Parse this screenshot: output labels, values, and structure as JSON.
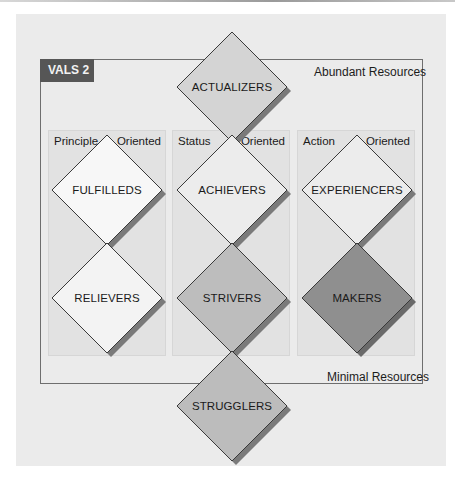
{
  "diagram": {
    "title_badge": "VALS 2",
    "top_label": "Abundant Resources",
    "bottom_label": "Minimal Resources",
    "columns": [
      {
        "left": "Principle",
        "right": "Oriented"
      },
      {
        "left": "Status",
        "right": "Oriented"
      },
      {
        "left": "Action",
        "right": "Oriented"
      }
    ],
    "segments": {
      "actualizers": {
        "label": "ACTUALIZERS",
        "fill": "#d4d4d4"
      },
      "fulfilleds": {
        "label": "FULFILLEDS",
        "fill": "#f7f7f7"
      },
      "achievers": {
        "label": "ACHIEVERS",
        "fill": "#ececec"
      },
      "experiencers": {
        "label": "EXPERIENCERS",
        "fill": "#ececec"
      },
      "relievers": {
        "label": "RELIEVERS",
        "fill": "#f3f3f3"
      },
      "strivers": {
        "label": "STRIVERS",
        "fill": "#bdbdbd"
      },
      "makers": {
        "label": "MAKERS",
        "fill": "#8f8f8f"
      },
      "strugglers": {
        "label": "STRUGGLERS",
        "fill": "#bcbcbc"
      }
    },
    "colors": {
      "badge_bg": "#565656",
      "panel_bg": "#ebebeb",
      "column_bg": "#e2e2e2",
      "shadow": "#7a7a7a",
      "border": "#6e6e6e"
    }
  }
}
